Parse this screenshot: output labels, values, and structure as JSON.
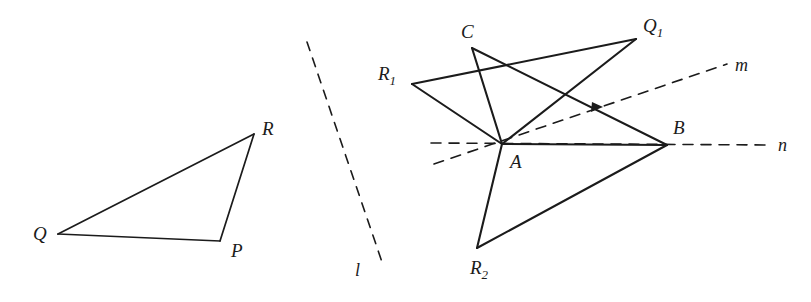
{
  "figure": {
    "background_color": "#ffffff",
    "stroke_color": "#1b1b1b",
    "left_shape": {
      "name": "triangle-pqr",
      "vertices": [
        {
          "label": "Q",
          "x": 58,
          "y": 234,
          "label_x": 33,
          "label_y": 224
        },
        {
          "label": "P",
          "x": 220,
          "y": 241,
          "label_x": 231,
          "label_y": 241
        },
        {
          "label": "R",
          "x": 254,
          "y": 134,
          "label_x": 262,
          "label_y": 119
        }
      ],
      "edges": [
        {
          "from": "Q",
          "to": "R"
        },
        {
          "from": "R",
          "to": "P"
        },
        {
          "from": "P",
          "to": "Q"
        }
      ]
    },
    "mirror_line": {
      "label": "l",
      "x1": 307,
      "y1": 42,
      "x2": 383,
      "y2": 265,
      "dashed": true,
      "label_x": 355,
      "label_y": 261
    },
    "right_shape": {
      "name": "reflection-construction",
      "points": [
        {
          "label": "A",
          "x": 502,
          "y": 144,
          "label_x": 510,
          "label_y": 152
        },
        {
          "label": "B",
          "x": 667,
          "y": 145,
          "label_x": 673,
          "label_y": 118
        },
        {
          "label": "C",
          "x": 472,
          "y": 48,
          "label_x": 461,
          "label_y": 22
        },
        {
          "label": "Q",
          "sub": "1",
          "x": 636,
          "y": 39,
          "label_x": 643,
          "label_y": 16
        },
        {
          "label": "R",
          "sub": "1",
          "x": 412,
          "y": 84,
          "label_x": 378,
          "label_y": 64
        },
        {
          "label": "R",
          "sub": "2",
          "x": 477,
          "y": 248,
          "label_x": 470,
          "label_y": 258
        }
      ],
      "solid_edges": [
        {
          "from": "R1",
          "to": "Q1"
        },
        {
          "from": "R1",
          "to": "A"
        },
        {
          "from": "C",
          "to": "A"
        },
        {
          "from": "C",
          "to": "B"
        },
        {
          "from": "A",
          "to": "Q1"
        },
        {
          "from": "A",
          "to": "B"
        },
        {
          "from": "A",
          "to": "R2"
        },
        {
          "from": "R2",
          "to": "B"
        }
      ],
      "arrow_marker": {
        "on_edge": "C-B",
        "x": 597,
        "y": 107
      }
    },
    "rays": [
      {
        "label": "m",
        "dashed": true,
        "x1": 434,
        "y1": 164,
        "x2": 727,
        "y2": 64,
        "label_x": 735,
        "label_y": 56
      },
      {
        "label": "n",
        "dashed": true,
        "x1": 431,
        "y1": 143,
        "x2": 770,
        "y2": 145,
        "label_x": 778,
        "label_y": 136
      }
    ]
  }
}
